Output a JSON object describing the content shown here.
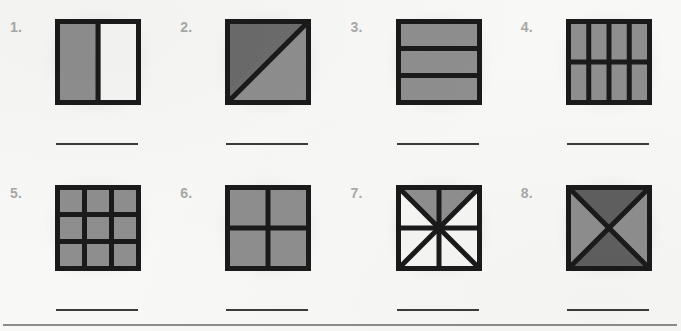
{
  "worksheet": {
    "background_color": "#f8f8f6",
    "label_color": "#a8a8a8",
    "stroke_color": "#1a1a1a",
    "answer_line_color": "#3b3b3b",
    "divider_color": "#8d8d8d",
    "shade_dark": "#6b6b6b",
    "shade_medium": "#8e8e8e",
    "shade_light": "#f4f4f2",
    "rows": [
      {
        "figures": [
          {
            "number": "1.",
            "shape": "square",
            "partition": "vertical-halves",
            "parts_total": 2,
            "parts_shaded": 1,
            "fills": [
              "#8e8e8e",
              "#f6f6f4"
            ],
            "answer_line": true,
            "answer_value": ""
          },
          {
            "number": "2.",
            "shape": "square",
            "partition": "diagonal-halves",
            "parts_total": 2,
            "parts_shaded": 2,
            "fills": [
              "#6b6b6b",
              "#8e8e8e"
            ],
            "answer_line": true,
            "answer_value": ""
          },
          {
            "number": "3.",
            "shape": "square",
            "partition": "horizontal-thirds",
            "parts_total": 3,
            "parts_shaded": 3,
            "fills": [
              "#8e8e8e",
              "#8e8e8e",
              "#8e8e8e"
            ],
            "answer_line": true,
            "answer_value": ""
          },
          {
            "number": "4.",
            "shape": "square",
            "partition": "grid-4x2",
            "parts_total": 8,
            "parts_shaded": 8,
            "fills": [
              "#8e8e8e"
            ],
            "answer_line": true,
            "answer_value": ""
          }
        ]
      },
      {
        "figures": [
          {
            "number": "5.",
            "shape": "square",
            "partition": "grid-3x3",
            "parts_total": 9,
            "parts_shaded": 9,
            "fills": [
              "#8e8e8e"
            ],
            "answer_line": true,
            "answer_value": ""
          },
          {
            "number": "6.",
            "shape": "square",
            "partition": "grid-2x2",
            "parts_total": 4,
            "parts_shaded": 4,
            "fills": [
              "#8e8e8e"
            ],
            "answer_line": true,
            "answer_value": ""
          },
          {
            "number": "7.",
            "shape": "square",
            "partition": "eighths-star",
            "parts_total": 8,
            "parts_shaded": 2,
            "fills": [
              "#8e8e8e",
              "#f6f6f4"
            ],
            "answer_line": true,
            "answer_value": ""
          },
          {
            "number": "8.",
            "shape": "square",
            "partition": "diagonal-quarters",
            "parts_total": 4,
            "parts_shaded": 4,
            "fills": [
              "#5f5f5f",
              "#8e8e8e"
            ],
            "answer_line": true,
            "answer_value": ""
          }
        ]
      }
    ],
    "bottom_divider": true
  }
}
